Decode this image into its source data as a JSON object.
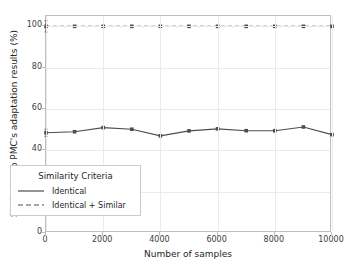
{
  "chart_data": {
    "type": "line",
    "title": "",
    "xlabel": "Number of samples",
    "ylabel": "Similarity to PMC's adaptation results (%)",
    "x": [
      0,
      1000,
      2000,
      3000,
      4000,
      5000,
      6000,
      7000,
      8000,
      9000,
      10000
    ],
    "xlim": [
      0,
      10000
    ],
    "ylim": [
      0,
      105
    ],
    "xticks": [
      "0",
      "2000",
      "4000",
      "6000",
      "8000",
      "10000"
    ],
    "xtick_values": [
      0,
      2000,
      4000,
      6000,
      8000,
      10000
    ],
    "yticks": [
      "0",
      "20",
      "40",
      "60",
      "80",
      "100"
    ],
    "ytick_values": [
      0,
      20,
      40,
      60,
      80,
      100
    ],
    "grid": true,
    "legend_position": "lower left",
    "legend_title": "Similarity Criteria",
    "series": [
      {
        "name": "Identical",
        "style": "solid",
        "color": "#4d4d4d",
        "marker": "square",
        "values": [
          48.5,
          49.0,
          51.0,
          50.2,
          47.0,
          49.4,
          50.4,
          49.5,
          49.5,
          51.3,
          47.6
        ],
        "errors": [
          3.5,
          0,
          0,
          0,
          0,
          0,
          0,
          0,
          0,
          0,
          0
        ]
      },
      {
        "name": "Identical + Similar",
        "style": "dashed",
        "color": "#4d4d4d",
        "marker": "square",
        "values": [
          100,
          100,
          100,
          100,
          100,
          100,
          100,
          100,
          100,
          100,
          100
        ],
        "errors": [
          5.5,
          0,
          0,
          0,
          0,
          0,
          0,
          0,
          0,
          0,
          0
        ]
      }
    ]
  },
  "legend": {
    "title": "Similarity Criteria",
    "items": [
      {
        "label": "Identical",
        "style": "solid"
      },
      {
        "label": "Identical + Similar",
        "style": "dashed"
      }
    ]
  }
}
